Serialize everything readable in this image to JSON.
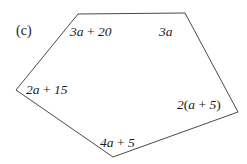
{
  "figure": {
    "part_label": "(c)",
    "shape": "pentagon",
    "stroke_color": "#4a4a4a",
    "background_color": "#ffffff",
    "vertices": [
      {
        "name": "top-left",
        "x": 78,
        "y": 14
      },
      {
        "name": "top-right",
        "x": 185,
        "y": 13
      },
      {
        "name": "right",
        "x": 238,
        "y": 112
      },
      {
        "name": "bottom",
        "x": 113,
        "y": 157
      },
      {
        "name": "left",
        "x": 16,
        "y": 90
      }
    ],
    "side_labels": [
      {
        "id": "top-left",
        "text": "3a + 20",
        "expression": "3a + 20"
      },
      {
        "id": "top-right",
        "text": "3a",
        "expression": "3a"
      },
      {
        "id": "left",
        "text": "2a + 15",
        "expression": "2a + 15"
      },
      {
        "id": "right",
        "text": "2(a + 5)",
        "expression": "2(a + 5)"
      },
      {
        "id": "bottom",
        "text": "4a + 5",
        "expression": "4a + 5"
      }
    ]
  }
}
